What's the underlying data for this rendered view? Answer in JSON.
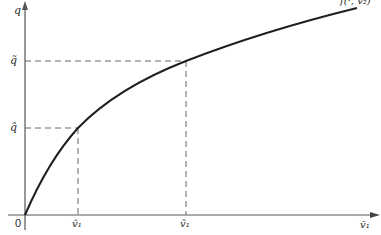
{
  "diagram": {
    "type": "production-function-graph",
    "axes": {
      "y_label": "q",
      "x_label": "v̄₁",
      "origin_label": "0"
    },
    "curve": {
      "label": "f(·, v̄₂)",
      "color": "#1e1e1e"
    },
    "reference_levels": [
      {
        "name": "q-hat",
        "y_label": "q̂",
        "x_label": "v̂₁"
      },
      {
        "name": "q-tilde",
        "y_label": "q̃",
        "x_label": "ṽ₁"
      }
    ],
    "colors": {
      "axis": "#555555",
      "dashed": "#666666",
      "text": "#2a2a2a",
      "background": "#ffffff"
    }
  }
}
